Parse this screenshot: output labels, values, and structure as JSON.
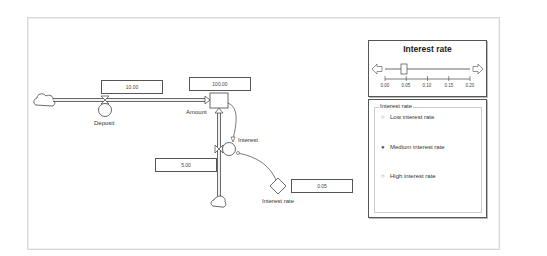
{
  "diagram": {
    "stock": {
      "name": "Amount",
      "value": "100.00"
    },
    "inflow": {
      "name": "Deposit",
      "value": "10.00"
    },
    "outflow": {
      "name": "Interest",
      "value": "5.00"
    },
    "constant": {
      "name": "Interest rate",
      "value": "0.05"
    }
  },
  "slider": {
    "title": "Interest rate",
    "min": 0.0,
    "max": 0.2,
    "value": 0.05,
    "ticks": [
      "0.00",
      "0.05",
      "0.10",
      "0.15",
      "0.20"
    ],
    "left_arrow_icon": "arrow-left-icon",
    "right_arrow_icon": "arrow-right-icon"
  },
  "radio_group": {
    "legend": "Interest rate",
    "options": [
      {
        "label": "Low interest rate",
        "selected": false
      },
      {
        "label": "Medium interest rate",
        "selected": true
      },
      {
        "label": "High interest rate",
        "selected": false
      }
    ],
    "unselected_mark": "○",
    "selected_mark": "●"
  },
  "colors": {
    "line": "#444444",
    "frame": "#d8d8d8"
  }
}
